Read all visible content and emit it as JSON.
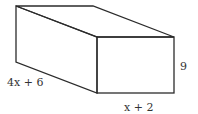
{
  "diagram": {
    "type": "rectangular-prism",
    "labels": {
      "length": "4x + 6",
      "width": "x + 2",
      "height": "9"
    },
    "colors": {
      "stroke": "#2b2b2b",
      "text": "#333333",
      "background": "#ffffff"
    }
  }
}
